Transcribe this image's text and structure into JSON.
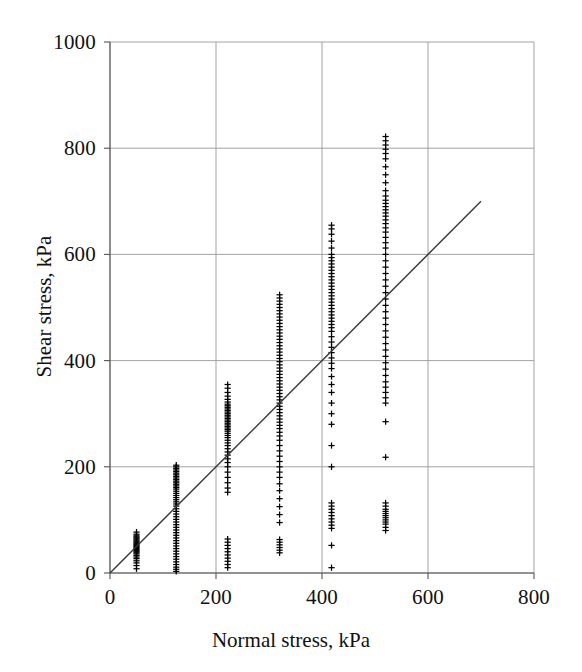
{
  "chart_data": {
    "type": "scatter",
    "title": "",
    "xlabel": "Normal stress, kPa",
    "ylabel": "Shear stress, kPa",
    "xlim": [
      0,
      800
    ],
    "ylim": [
      0,
      1000
    ],
    "xticks": [
      0,
      200,
      400,
      600,
      800
    ],
    "yticks": [
      0,
      200,
      400,
      600,
      800,
      1000
    ],
    "xtick_labels": [
      "0",
      "200",
      "400",
      "600",
      "800"
    ],
    "ytick_labels": [
      "0",
      "200",
      "400",
      "600",
      "800",
      "1000"
    ],
    "grid": true,
    "legend": "none",
    "marker": "plus",
    "marker_color": "#000000",
    "grid_color": "#999999",
    "axis_color": "#555555",
    "trendline": {
      "type": "line",
      "x": [
        0,
        700
      ],
      "y": [
        0,
        700
      ],
      "slope": 1.0,
      "intercept": 0,
      "color": "#3a3a3a"
    },
    "series": [
      {
        "name": "Direct shear test results",
        "x_groups": [
          50,
          125,
          222,
          320,
          418,
          520
        ],
        "points": [
          {
            "x": 50,
            "y": [
              8,
              14,
              19,
              23,
              27,
              30,
              33,
              36,
              38,
              40,
              42,
              44,
              46,
              48,
              50,
              52,
              54,
              56,
              58,
              60,
              62,
              64,
              66,
              68,
              70,
              73,
              77
            ]
          },
          {
            "x": 125,
            "y": [
              3,
              7,
              11,
              16,
              21,
              26,
              31,
              36,
              41,
              46,
              51,
              56,
              61,
              66,
              71,
              76,
              81,
              86,
              91,
              96,
              101,
              106,
              111,
              116,
              121,
              126,
              130,
              134,
              138,
              142,
              146,
              150,
              154,
              158,
              161,
              164,
              167,
              170,
              173,
              176,
              179,
              182,
              185,
              188,
              191,
              194,
              197,
              200,
              203
            ]
          },
          {
            "x": 222,
            "y": [
              10,
              16,
              22,
              28,
              34,
              40,
              46,
              52,
              58,
              64,
              152,
              160,
              170,
              180,
              190,
              200,
              208,
              215,
              222,
              228,
              234,
              240,
              245,
              250,
              255,
              259,
              263,
              267,
              270,
              273,
              276,
              279,
              282,
              285,
              288,
              291,
              294,
              297,
              300,
              303,
              306,
              309,
              312,
              315,
              318,
              322,
              327,
              333,
              340,
              348,
              355
            ]
          },
          {
            "x": 320,
            "y": [
              38,
              43,
              48,
              53,
              58,
              63,
              95,
              110,
              125,
              140,
              155,
              168,
              180,
              190,
              200,
              210,
              220,
              230,
              240,
              250,
              258,
              265,
              272,
              278,
              284,
              290,
              296,
              302,
              308,
              314,
              320,
              326,
              332,
              338,
              344,
              350,
              356,
              362,
              368,
              374,
              380,
              386,
              392,
              398,
              404,
              410,
              416,
              422,
              428,
              434,
              440,
              446,
              452,
              458,
              464,
              470,
              476,
              482,
              488,
              494,
              500,
              506,
              512,
              518,
              524
            ]
          },
          {
            "x": 418,
            "y": [
              10,
              52,
              84,
              90,
              96,
              102,
              108,
              114,
              120,
              126,
              132,
              200,
              240,
              280,
              300,
              320,
              340,
              355,
              370,
              385,
              395,
              405,
              415,
              425,
              435,
              445,
              455,
              462,
              468,
              474,
              480,
              486,
              492,
              498,
              504,
              510,
              516,
              522,
              528,
              534,
              540,
              546,
              552,
              558,
              564,
              570,
              576,
              582,
              588,
              594,
              600,
              612,
              625,
              638,
              648,
              655
            ]
          },
          {
            "x": 520,
            "y": [
              80,
              86,
              92,
              96,
              100,
              104,
              108,
              112,
              116,
              120,
              126,
              132,
              218,
              285,
              320,
              330,
              340,
              350,
              360,
              372,
              384,
              396,
              408,
              420,
              432,
              444,
              456,
              468,
              480,
              492,
              504,
              516,
              528,
              540,
              552,
              564,
              576,
              588,
              600,
              612,
              622,
              632,
              642,
              650,
              658,
              665,
              672,
              678,
              684,
              690,
              696,
              702,
              710,
              720,
              735,
              750,
              765,
              780,
              790,
              798,
              806,
              814,
              822
            ]
          }
        ]
      }
    ]
  }
}
